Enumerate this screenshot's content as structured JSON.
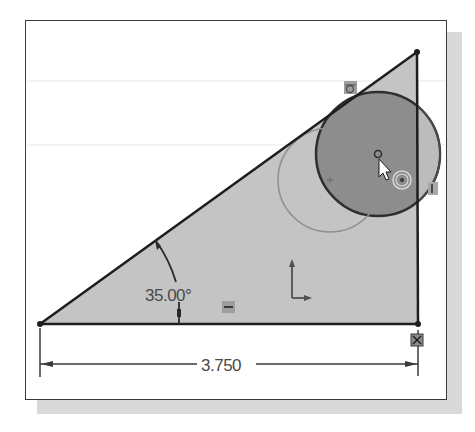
{
  "sketch": {
    "triangle": {
      "vertices": {
        "bottom_left": [
          40,
          324
        ],
        "bottom_right": [
          418,
          324
        ],
        "top_right": [
          417,
          52
        ]
      },
      "fill": "#c4c4c4",
      "stroke": "#1e1e1e"
    },
    "circles": [
      {
        "name": "active-circle",
        "cx": 378,
        "cy": 154,
        "r": 62,
        "fill": "#8a8a8a",
        "stroke": "#2e2e2e"
      },
      {
        "name": "ghost-circle",
        "cx": 330,
        "cy": 180,
        "r": 52,
        "fill": "none",
        "stroke": "#9a9a9a"
      }
    ],
    "dimensions": {
      "angle": {
        "label": "35.00°",
        "value": 35.0,
        "unit": "deg"
      },
      "linear": {
        "label": "3.750",
        "value": 3.75
      }
    },
    "constraint_icons": [
      {
        "name": "tangent-relation-icon",
        "x": 351,
        "y": 88
      },
      {
        "name": "horizontal-relation-icon",
        "x": 229,
        "y": 307
      },
      {
        "name": "vertical-relation-icon",
        "x": 433,
        "y": 188
      },
      {
        "name": "fixed-relation-icon",
        "x": 417,
        "y": 340
      }
    ],
    "colors": {
      "background": "#ffffff",
      "frame": "#3a3a3a",
      "shadow": "#d9d9d9",
      "dimension_line": "#3a3a3a",
      "icon_bg": "#9e9e9e"
    }
  }
}
